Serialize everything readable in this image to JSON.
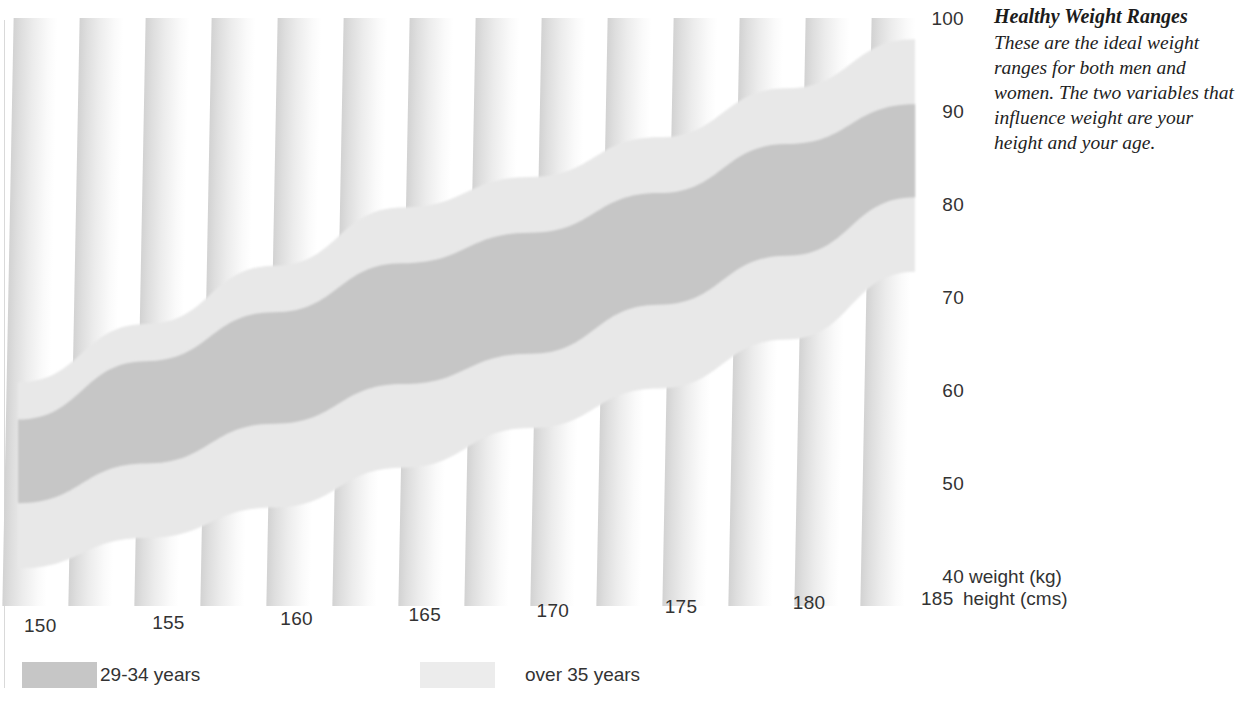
{
  "note": {
    "title": "Healthy Weight Ranges",
    "body": "These are the ideal weight ranges for both men and women. The two variables that influence weight are your height and your age."
  },
  "axes": {
    "y_label": "weight (kg)",
    "x_label": "height (cms)",
    "y_ticks": [
      "100",
      "90",
      "80",
      "70",
      "60",
      "50",
      "40"
    ],
    "x_ticks": [
      "150",
      "155",
      "160",
      "165",
      "170",
      "175",
      "180",
      "185"
    ]
  },
  "legend": {
    "items": [
      {
        "label": "29-34 years",
        "color": "#c6c6c6"
      },
      {
        "label": "over 35 years",
        "color": "#ececec"
      }
    ]
  },
  "colors": {
    "band_29_34": "#c6c6c6",
    "band_over_35": "#e8e8e8",
    "stripe_dark": "#d2d2d2",
    "page_background": "#ffffff",
    "text": "#333333"
  },
  "chart_data": {
    "type": "area",
    "title": "Healthy Weight Ranges",
    "xlabel": "height (cms)",
    "ylabel": "weight (kg)",
    "xlim": [
      150,
      185
    ],
    "ylim": [
      40,
      100
    ],
    "grid": false,
    "legend_position": "below",
    "x": [
      150,
      155,
      160,
      165,
      170,
      175,
      180,
      185
    ],
    "series": [
      {
        "name": "over 35 years",
        "type": "band",
        "color": "#e8e8e8",
        "upper": [
          61,
          67,
          73,
          79,
          82,
          86,
          91,
          96
        ],
        "lower": [
          41,
          44,
          47,
          51,
          55,
          59,
          64,
          71
        ]
      },
      {
        "name": "29-34 years",
        "type": "band",
        "color": "#c6c6c6",
        "upper": [
          57,
          63,
          68,
          73,
          76,
          80,
          85,
          89
        ],
        "lower": [
          48,
          52,
          56,
          60,
          63,
          68,
          73,
          79
        ]
      }
    ]
  }
}
